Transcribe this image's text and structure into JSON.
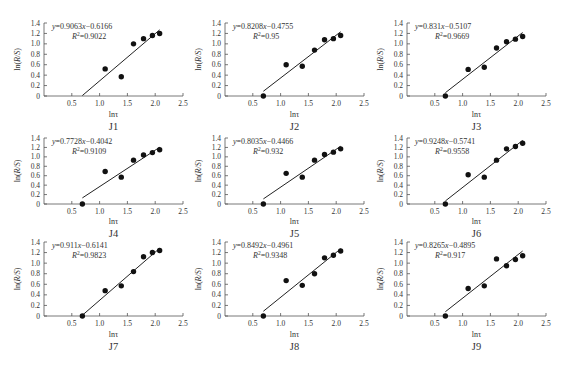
{
  "chart_data": [
    {
      "type": "scatter",
      "panel": "J1",
      "title": "J1",
      "xlabel": "lnτ",
      "ylabel": "ln(R/S)",
      "xlim": [
        0,
        2.5
      ],
      "ylim": [
        0,
        1.4
      ],
      "xticks": [
        "0.5",
        "1.0",
        "1.5",
        "2.0",
        "2.5"
      ],
      "yticks": [
        "0",
        "0.2",
        "0.4",
        "0.6",
        "0.8",
        "1.0",
        "1.2",
        "1.4"
      ],
      "equation": "y=0.9063x−0.6166",
      "r2": "R²=0.9022",
      "fit": {
        "slope": 0.9063,
        "intercept": -0.6166,
        "x_range": [
          0.69,
          2.08
        ]
      },
      "x": [
        1.1,
        1.39,
        1.61,
        1.79,
        1.95,
        2.08
      ],
      "y": [
        0.52,
        0.37,
        1.0,
        1.1,
        1.16,
        1.2
      ],
      "grid": false
    },
    {
      "type": "scatter",
      "panel": "J2",
      "title": "J2",
      "xlabel": "lnτ",
      "ylabel": "ln(R/S)",
      "xlim": [
        0,
        2.5
      ],
      "ylim": [
        0,
        1.4
      ],
      "xticks": [
        "0.5",
        "1.0",
        "1.5",
        "2.0",
        "2.5"
      ],
      "yticks": [
        "0",
        "0.2",
        "0.4",
        "0.6",
        "0.8",
        "1.0",
        "1.2",
        "1.4"
      ],
      "equation": "y=0.8208x−0.4755",
      "r2": "R²=0.95",
      "fit": {
        "slope": 0.8208,
        "intercept": -0.4755,
        "x_range": [
          0.69,
          2.08
        ]
      },
      "x": [
        0.69,
        1.1,
        1.39,
        1.61,
        1.79,
        1.95,
        2.08
      ],
      "y": [
        0.0,
        0.6,
        0.57,
        0.88,
        1.08,
        1.1,
        1.16
      ],
      "grid": false
    },
    {
      "type": "scatter",
      "panel": "J3",
      "title": "J3",
      "xlabel": "lnτ",
      "ylabel": "ln(R/S)",
      "xlim": [
        0,
        2.5
      ],
      "ylim": [
        0,
        1.4
      ],
      "xticks": [
        "0.5",
        "1.0",
        "1.5",
        "2.0",
        "2.5"
      ],
      "yticks": [
        "0",
        "0.2",
        "0.4",
        "0.6",
        "0.8",
        "1.0",
        "1.2",
        "1.4"
      ],
      "equation": "y=0.831x−0.5107",
      "r2": "R²=0.9669",
      "fit": {
        "slope": 0.831,
        "intercept": -0.5107,
        "x_range": [
          0.69,
          2.08
        ]
      },
      "x": [
        0.69,
        1.1,
        1.39,
        1.61,
        1.79,
        1.95,
        2.08
      ],
      "y": [
        0.0,
        0.51,
        0.55,
        0.92,
        1.04,
        1.09,
        1.14
      ],
      "grid": false
    },
    {
      "type": "scatter",
      "panel": "J4",
      "title": "J4",
      "xlabel": "lnτ",
      "ylabel": "ln(R/S)",
      "xlim": [
        0,
        2.5
      ],
      "ylim": [
        0,
        1.4
      ],
      "xticks": [
        "0.5",
        "1.0",
        "1.5",
        "2.0",
        "2.5"
      ],
      "yticks": [
        "0",
        "0.2",
        "0.4",
        "0.6",
        "0.8",
        "1.0",
        "1.2",
        "1.4"
      ],
      "equation": "y=0.7728x−0.4042",
      "r2": "R²=0.9109",
      "fit": {
        "slope": 0.7728,
        "intercept": -0.4042,
        "x_range": [
          0.69,
          2.08
        ]
      },
      "x": [
        0.69,
        1.1,
        1.39,
        1.61,
        1.79,
        1.95,
        2.08
      ],
      "y": [
        0.0,
        0.69,
        0.57,
        0.93,
        1.04,
        1.09,
        1.15
      ],
      "grid": false
    },
    {
      "type": "scatter",
      "panel": "J5",
      "title": "J5",
      "xlabel": "lnτ",
      "ylabel": "ln(R/S)",
      "xlim": [
        0,
        2.5
      ],
      "ylim": [
        0,
        1.4
      ],
      "xticks": [
        "0.5",
        "1.0",
        "1.5",
        "2.0",
        "2.5"
      ],
      "yticks": [
        "0",
        "0.2",
        "0.4",
        "0.6",
        "0.8",
        "1.0",
        "1.2",
        "1.4"
      ],
      "equation": "y=0.8035x−0.4466",
      "r2": "R²=0.932",
      "fit": {
        "slope": 0.8035,
        "intercept": -0.4466,
        "x_range": [
          0.69,
          2.08
        ]
      },
      "x": [
        0.69,
        1.1,
        1.39,
        1.61,
        1.79,
        1.95,
        2.08
      ],
      "y": [
        0.0,
        0.65,
        0.57,
        0.93,
        1.05,
        1.1,
        1.17
      ],
      "grid": false
    },
    {
      "type": "scatter",
      "panel": "J6",
      "title": "J6",
      "xlabel": "lnτ",
      "ylabel": "ln(R/S)",
      "xlim": [
        0,
        2.5
      ],
      "ylim": [
        0,
        1.4
      ],
      "xticks": [
        "0.5",
        "1.0",
        "1.5",
        "2.0",
        "2.5"
      ],
      "yticks": [
        "0",
        "0.2",
        "0.4",
        "0.6",
        "0.8",
        "1.0",
        "1.2",
        "1.4"
      ],
      "equation": "y=0.9248x−0.5741",
      "r2": "R²=0.9558",
      "fit": {
        "slope": 0.9248,
        "intercept": -0.5741,
        "x_range": [
          0.69,
          2.08
        ]
      },
      "x": [
        0.69,
        1.1,
        1.39,
        1.61,
        1.79,
        1.95,
        2.08
      ],
      "y": [
        0.0,
        0.62,
        0.57,
        0.93,
        1.17,
        1.22,
        1.29
      ],
      "grid": false
    },
    {
      "type": "scatter",
      "panel": "J7",
      "title": "J7",
      "xlabel": "lnτ",
      "ylabel": "ln(R/S)",
      "xlim": [
        0,
        2.5
      ],
      "ylim": [
        0,
        1.4
      ],
      "xticks": [
        "0.5",
        "1.0",
        "1.5",
        "2.0",
        "2.5"
      ],
      "yticks": [
        "0",
        "0.2",
        "0.4",
        "0.6",
        "0.8",
        "1.0",
        "1.2",
        "1.4"
      ],
      "equation": "y=0.911x−0.6141",
      "r2": "R²=0.9823",
      "fit": {
        "slope": 0.911,
        "intercept": -0.6141,
        "x_range": [
          0.69,
          2.08
        ]
      },
      "x": [
        0.69,
        1.1,
        1.39,
        1.61,
        1.79,
        1.95,
        2.08
      ],
      "y": [
        0.0,
        0.48,
        0.57,
        0.84,
        1.12,
        1.2,
        1.24
      ],
      "grid": false
    },
    {
      "type": "scatter",
      "panel": "J8",
      "title": "J8",
      "xlabel": "lnτ",
      "ylabel": "ln(R/S)",
      "xlim": [
        0,
        2.5
      ],
      "ylim": [
        0,
        1.4
      ],
      "xticks": [
        "0.5",
        "1.0",
        "1.5",
        "2.0",
        "2.5"
      ],
      "yticks": [
        "0",
        "0.2",
        "0.4",
        "0.6",
        "0.8",
        "1.0",
        "1.2",
        "1.4"
      ],
      "equation": "y=0.8492x−0.4961",
      "r2": "R²=0.9348",
      "fit": {
        "slope": 0.8492,
        "intercept": -0.4961,
        "x_range": [
          0.69,
          2.08
        ]
      },
      "x": [
        0.69,
        1.1,
        1.39,
        1.61,
        1.79,
        1.95,
        2.08
      ],
      "y": [
        0.0,
        0.67,
        0.58,
        0.8,
        1.1,
        1.15,
        1.23
      ],
      "grid": false
    },
    {
      "type": "scatter",
      "panel": "J9",
      "title": "J9",
      "xlabel": "lnτ",
      "ylabel": "ln(R/S)",
      "xlim": [
        0,
        2.5
      ],
      "ylim": [
        0,
        1.4
      ],
      "xticks": [
        "0.5",
        "1.0",
        "1.5",
        "2.0",
        "2.5"
      ],
      "yticks": [
        "0",
        "0.2",
        "0.4",
        "0.6",
        "0.8",
        "1.0",
        "1.2",
        "1.4"
      ],
      "equation": "y=0.8265x−0.4895",
      "r2": "R²=0.917",
      "fit": {
        "slope": 0.8265,
        "intercept": -0.4895,
        "x_range": [
          0.69,
          2.08
        ]
      },
      "x": [
        0.69,
        1.1,
        1.39,
        1.61,
        1.79,
        1.95,
        2.08
      ],
      "y": [
        0.0,
        0.52,
        0.57,
        1.08,
        0.95,
        1.07,
        1.14
      ],
      "grid": false
    }
  ],
  "layout": {
    "columns_axis_x": [
      44,
      225,
      407
    ],
    "rows": [
      {
        "top": 23,
        "bottom": 96,
        "xtick_y": 106,
        "xlabel_y": 117,
        "title_y": 130
      },
      {
        "top": 138,
        "bottom": 204,
        "xtick_y": 214,
        "xlabel_y": 224,
        "title_y": 237
      },
      {
        "top": 242,
        "bottom": 316,
        "xtick_y": 326,
        "xlabel_y": 337,
        "title_y": 350
      }
    ],
    "px_per_unit_x": 55.6
  }
}
